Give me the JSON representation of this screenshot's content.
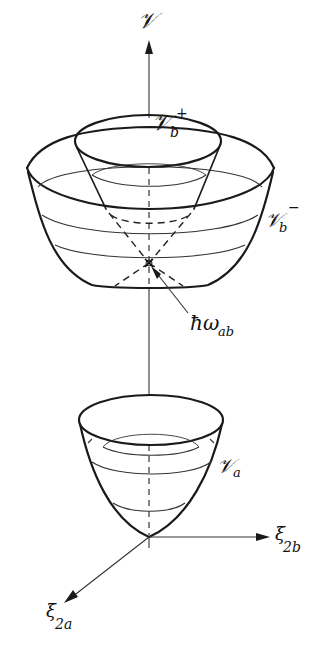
{
  "diagram": {
    "type": "potential energy surfaces (conical intersection)",
    "labels": {
      "vertical_axis": "𝒱",
      "upper_cone": {
        "main": "𝒱",
        "sub": "b",
        "sup": "+"
      },
      "outer_bowl": {
        "main": "𝒱",
        "sub": "b",
        "sup": "−"
      },
      "lower_bowl": {
        "main": "𝒱",
        "sub": "a"
      },
      "intersection": {
        "main": "ħω",
        "sub": "ab"
      },
      "x_axis": {
        "main": "ξ",
        "sub": "2b"
      },
      "z_axis": {
        "main": "ξ",
        "sub": "2a"
      }
    },
    "colors": {
      "line": "#1a1a1a",
      "background": "#ffffff"
    }
  }
}
